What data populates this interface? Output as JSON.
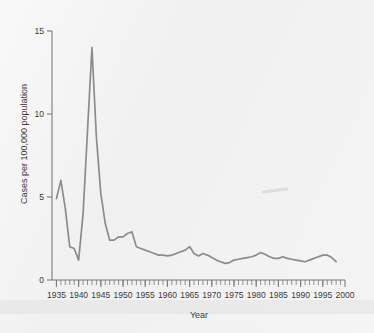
{
  "chart_data": {
    "type": "line",
    "title": "",
    "xlabel": "Year",
    "ylabel": "Cases per 100,000 population",
    "xlim": [
      1934,
      2000
    ],
    "ylim": [
      0,
      15
    ],
    "grid": false,
    "legend": null,
    "y_ticks": [
      0,
      5,
      10,
      15
    ],
    "y_tick_labels": [
      "0",
      "5",
      "10",
      "15"
    ],
    "x_ticks": [
      1935,
      1940,
      1945,
      1950,
      1955,
      1960,
      1965,
      1970,
      1975,
      1980,
      1985,
      1990,
      1995,
      2000
    ],
    "x_tick_labels": [
      "1935",
      "1940",
      "1945",
      "1950",
      "1955",
      "1960",
      "1965",
      "1970",
      "1975",
      "1980",
      "1985",
      "1990",
      "1995",
      "2000"
    ],
    "x_minor_tick_interval": 1,
    "line_color": "#8c8c8c",
    "background_color": "#f1f1f1",
    "series": [
      {
        "name": "Cases per 100,000 population",
        "x": [
          1935,
          1936,
          1937,
          1938,
          1939,
          1940,
          1941,
          1942,
          1943,
          1944,
          1945,
          1946,
          1947,
          1948,
          1949,
          1950,
          1951,
          1952,
          1953,
          1954,
          1955,
          1956,
          1957,
          1958,
          1959,
          1960,
          1961,
          1962,
          1963,
          1964,
          1965,
          1966,
          1967,
          1968,
          1969,
          1970,
          1971,
          1972,
          1973,
          1974,
          1975,
          1976,
          1977,
          1978,
          1979,
          1980,
          1981,
          1982,
          1983,
          1984,
          1985,
          1986,
          1987,
          1988,
          1989,
          1990,
          1991,
          1992,
          1993,
          1994,
          1995,
          1996,
          1997,
          1998
        ],
        "values": [
          4.9,
          6.0,
          4.3,
          2.0,
          1.9,
          1.2,
          4.0,
          9.0,
          14.0,
          8.6,
          5.2,
          3.4,
          2.4,
          2.4,
          2.6,
          2.6,
          2.8,
          2.9,
          2.0,
          1.9,
          1.8,
          1.7,
          1.6,
          1.5,
          1.5,
          1.45,
          1.5,
          1.6,
          1.7,
          1.8,
          2.0,
          1.6,
          1.45,
          1.6,
          1.5,
          1.35,
          1.2,
          1.1,
          1.0,
          1.05,
          1.2,
          1.25,
          1.3,
          1.35,
          1.4,
          1.5,
          1.65,
          1.55,
          1.4,
          1.3,
          1.3,
          1.4,
          1.3,
          1.25,
          1.2,
          1.15,
          1.1,
          1.2,
          1.3,
          1.4,
          1.5,
          1.5,
          1.35,
          1.1
        ]
      }
    ]
  },
  "axes": {
    "y_title": "Cases per 100,000 population",
    "x_title": "Year"
  }
}
